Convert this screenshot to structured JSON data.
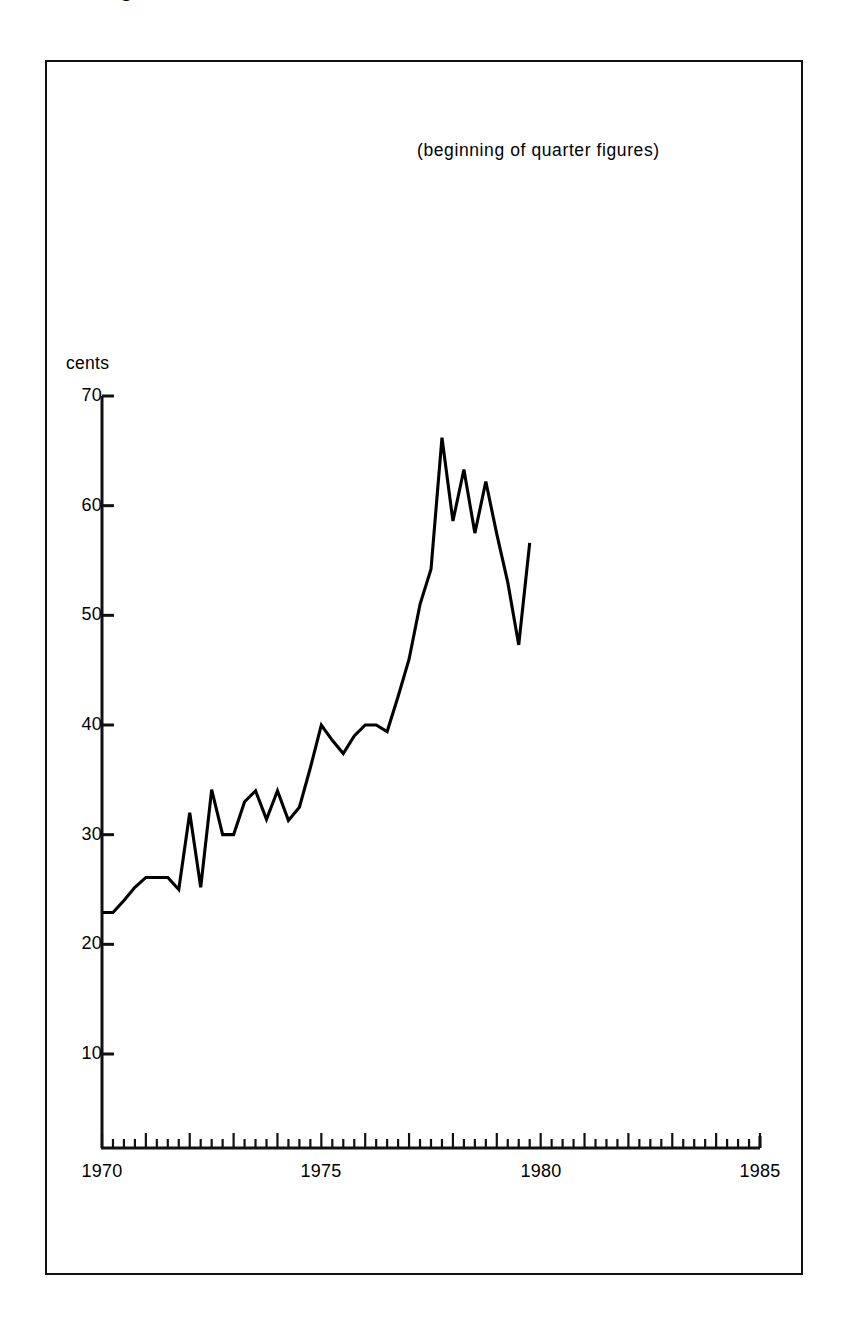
{
  "figure": {
    "title_fragment": "g",
    "subtitle": "(beginning of quarter figures)",
    "y_axis_unit_label": "cents"
  },
  "axes": {
    "y_ticks": [
      "70",
      "60",
      "50",
      "40",
      "30",
      "20",
      "10"
    ],
    "x_ticks": [
      "1970",
      "1975",
      "1980",
      "1985"
    ]
  },
  "chart_data": {
    "type": "line",
    "title": "",
    "subtitle": "(beginning of quarter figures)",
    "xlabel": "",
    "ylabel": "cents",
    "xlim": [
      1970,
      1985
    ],
    "ylim": [
      0,
      70
    ],
    "y_tick_values": [
      10,
      20,
      30,
      40,
      50,
      60,
      70
    ],
    "x_tick_values": [
      1970,
      1975,
      1980,
      1985
    ],
    "x_minor_tick_interval_years": 0.25,
    "grid": false,
    "legend": null,
    "line_color": "#000000",
    "series": [
      {
        "name": "cents",
        "x": [
          1970.0,
          1970.25,
          1970.5,
          1970.75,
          1971.0,
          1971.25,
          1971.5,
          1971.75,
          1972.0,
          1972.25,
          1972.5,
          1972.75,
          1973.0,
          1973.25,
          1973.5,
          1973.75,
          1974.0,
          1974.25,
          1974.5,
          1974.75,
          1975.0,
          1975.25,
          1975.5,
          1975.75,
          1976.0,
          1976.25,
          1976.5,
          1976.75,
          1977.0,
          1977.25,
          1977.5,
          1977.75,
          1978.0,
          1978.25,
          1978.5,
          1978.75,
          1979.0,
          1979.25,
          1979.5,
          1979.75,
          1980.0,
          1980.25,
          1980.5,
          1980.75,
          1981.0,
          1981.25,
          1981.5,
          1981.75,
          1982.0,
          1982.25
        ],
        "values": [
          22.9,
          22.9,
          24.0,
          25.2,
          26.1,
          26.1,
          26.1,
          25.0,
          32.0,
          25.2,
          34.1,
          30.0,
          30.0,
          33.0,
          34.0,
          31.4,
          34.0,
          31.3,
          32.5,
          36.1,
          40.0,
          38.6,
          37.4,
          39.0,
          40.0,
          40.0,
          39.4,
          42.6,
          46.0,
          51.0,
          54.2,
          66.2,
          58.6,
          63.3,
          57.5,
          62.2,
          57.4,
          53.0,
          47.3,
          56.6,
          null,
          null,
          null,
          null,
          null,
          null,
          null,
          null,
          null,
          null
        ]
      }
    ]
  }
}
